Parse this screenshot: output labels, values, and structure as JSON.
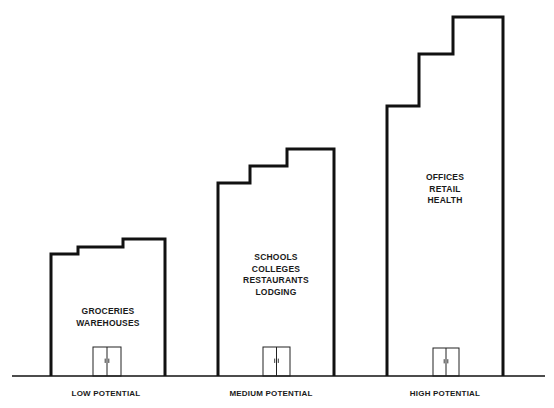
{
  "diagram": {
    "ground_line": {
      "x1": 12,
      "x2": 545,
      "y": 376
    },
    "buildings": [
      {
        "id": "low",
        "category": "LOW POTENTIAL",
        "uses": [
          "GROCERIES",
          "WAREHOUSES"
        ],
        "outline": "51,376 51,254 78,254 78,247 123,247 123,239 165,239 165,376",
        "door": {
          "x": 93,
          "y": 347,
          "w": 28,
          "h": 29
        }
      },
      {
        "id": "medium",
        "category": "MEDIUM POTENTIAL",
        "uses": [
          "SCHOOLS",
          "COLLEGES",
          "RESTAURANTS",
          "LODGING"
        ],
        "outline": "218,376 218,183 250,183 250,166 287,166 287,149 334,149 334,376",
        "door": {
          "x": 263,
          "y": 347,
          "w": 27,
          "h": 29
        }
      },
      {
        "id": "high",
        "category": "HIGH POTENTIAL",
        "uses": [
          "OFFICES",
          "RETAIL",
          "HEALTH"
        ],
        "outline": "387,376 387,106 419,106 419,54 453,54 453,17 503,17 503,376",
        "door": {
          "x": 433,
          "y": 348,
          "w": 26,
          "h": 28
        }
      }
    ],
    "stroke_color": "#111111"
  }
}
